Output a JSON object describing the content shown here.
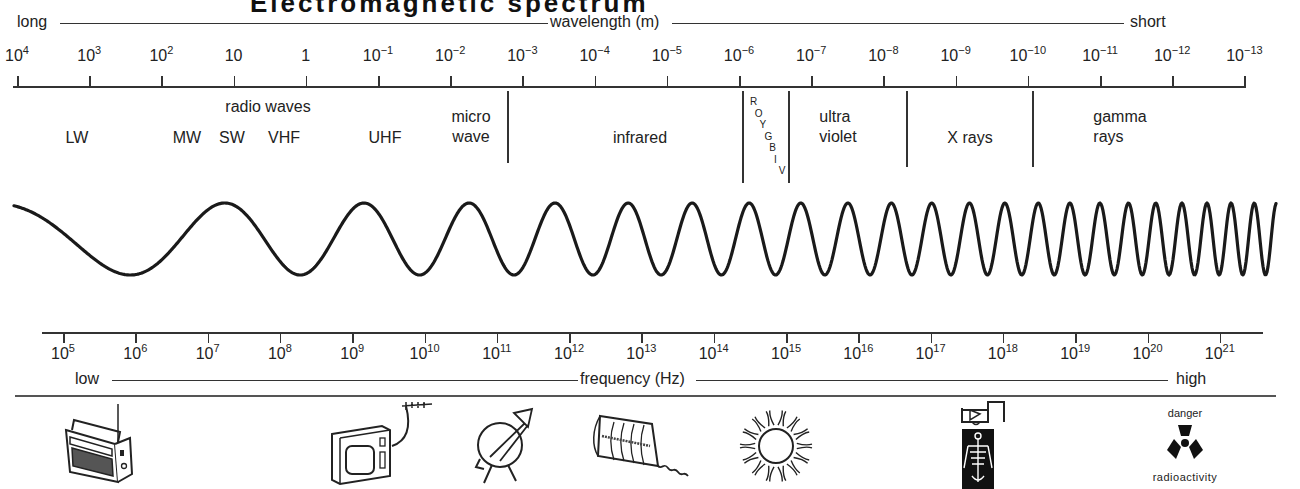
{
  "title": {
    "text": "Electromagnetic spectrum"
  },
  "wavelength_axis": {
    "left_label": "long",
    "center_label": "wavelength (m)",
    "right_label": "short",
    "ticks": [
      {
        "base": "10",
        "exp": "4"
      },
      {
        "base": "10",
        "exp": "3"
      },
      {
        "base": "10",
        "exp": "2"
      },
      {
        "base": "10",
        "exp": ""
      },
      {
        "base": "1",
        "exp": ""
      },
      {
        "base": "10",
        "exp": "−1"
      },
      {
        "base": "10",
        "exp": "−2"
      },
      {
        "base": "10",
        "exp": "−3"
      },
      {
        "base": "10",
        "exp": "−4"
      },
      {
        "base": "10",
        "exp": "−5"
      },
      {
        "base": "10",
        "exp": "−6"
      },
      {
        "base": "10",
        "exp": "−7"
      },
      {
        "base": "10",
        "exp": "−8"
      },
      {
        "base": "10",
        "exp": "−9"
      },
      {
        "base": "10",
        "exp": "−10"
      },
      {
        "base": "10",
        "exp": "−11"
      },
      {
        "base": "10",
        "exp": "−12"
      },
      {
        "base": "10",
        "exp": "−13"
      }
    ]
  },
  "regions": {
    "radio_header": "radio waves",
    "lw": "LW",
    "mw": "MW",
    "sw": "SW",
    "vhf": "VHF",
    "uhf": "UHF",
    "microwave_line1": "micro",
    "microwave_line2": "wave",
    "infrared": "infrared",
    "visible_letters": [
      "R",
      "O",
      "Y",
      "G",
      "B",
      "I",
      "V"
    ],
    "ultraviolet_line1": "ultra",
    "ultraviolet_line2": "violet",
    "xrays": "X rays",
    "gamma_line1": "gamma",
    "gamma_line2": "rays"
  },
  "frequency_axis": {
    "left_label": "low",
    "center_label": "frequency (Hz)",
    "right_label": "high",
    "ticks": [
      {
        "base": "10",
        "exp": "5"
      },
      {
        "base": "10",
        "exp": "6"
      },
      {
        "base": "10",
        "exp": "7"
      },
      {
        "base": "10",
        "exp": "8"
      },
      {
        "base": "10",
        "exp": "9"
      },
      {
        "base": "10",
        "exp": "10"
      },
      {
        "base": "10",
        "exp": "11"
      },
      {
        "base": "10",
        "exp": "12"
      },
      {
        "base": "10",
        "exp": "13"
      },
      {
        "base": "10",
        "exp": "14"
      },
      {
        "base": "10",
        "exp": "15"
      },
      {
        "base": "10",
        "exp": "16"
      },
      {
        "base": "10",
        "exp": "17"
      },
      {
        "base": "10",
        "exp": "18"
      },
      {
        "base": "10",
        "exp": "19"
      },
      {
        "base": "10",
        "exp": "20"
      },
      {
        "base": "10",
        "exp": "21"
      }
    ]
  },
  "illustrations": {
    "radio": "radio-icon",
    "television": "television-icon",
    "satellite_dish": "satellite-dish-icon",
    "heater": "radiant-heater-icon",
    "sun": "sun-icon",
    "xray": "xray-icon",
    "radioactivity_top": "danger",
    "radioactivity_bottom": "radioactivity"
  },
  "colors": {
    "ink": "#1a1a1a",
    "background": "#ffffff"
  }
}
